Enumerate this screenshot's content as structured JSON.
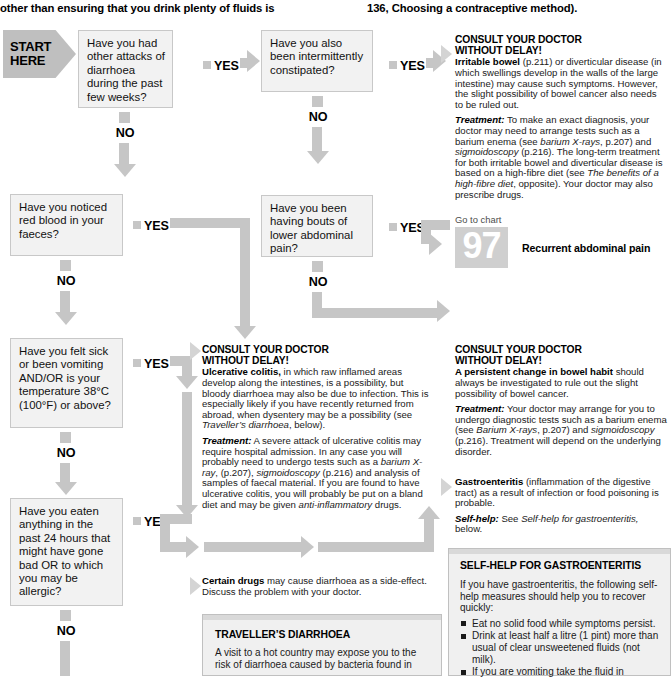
{
  "header": {
    "left_text": "other than ensuring that you drink plenty of fluids is",
    "right_text": "136, Choosing a contraceptive method)."
  },
  "start": {
    "line1": "START",
    "line2": "HERE"
  },
  "labels": {
    "yes": "YES",
    "no": "NO"
  },
  "questions": [
    {
      "id": "q1",
      "text": "Have you had other attacks of diarrhoea during the past few weeks?"
    },
    {
      "id": "q2",
      "text": "Have you also been intermittently constipated?"
    },
    {
      "id": "q3",
      "text": "Have you been having bouts of lower abdominal pain?"
    },
    {
      "id": "q4",
      "text": "Have you noticed red blood in your faeces?"
    },
    {
      "id": "q5",
      "text": "Have you felt sick or been vomiting AND/OR is your temperature 38°C (100°F) or above?"
    },
    {
      "id": "q6",
      "text": "Have you eaten anything in the past 24 hours that might have gone bad OR to which you may be allergic?"
    }
  ],
  "advice_irritable_bowel": {
    "heading_line1": "CONSULT YOUR DOCTOR",
    "heading_line2": "WITHOUT DELAY!",
    "para1_bold": "Irritable bowel",
    "para1_rest": " (p.211) or diverticular disease (in which swellings develop in the walls of the large intestine) may cause such symptoms. However, the slight possibility of bowel cancer also needs to be ruled out.",
    "para2_label": "Treatment:",
    "para2_a": " To make an exact diagnosis, your doctor may need to arrange tests such as a barium enema (see ",
    "para2_i1": "barium X-rays",
    "para2_b": ", p.207) and ",
    "para2_i2": "sigmoidoscopy",
    "para2_c": " (p.216). The long-term treatment for both irritable bowel and diverticular disease is based on a high-fibre diet (see ",
    "para2_i3": "The benefits of a high-fibre diet",
    "para2_d": ", opposite). Your doctor may also prescribe drugs."
  },
  "go_to_chart": {
    "label": "Go to chart",
    "number": "97",
    "caption": "Recurrent abdominal pain"
  },
  "advice_ulcerative": {
    "heading_line1": "CONSULT YOUR DOCTOR",
    "heading_line2": "WITHOUT DELAY!",
    "para1_bold": "Ulcerative colitis,",
    "para1_rest": " in which raw inflamed areas develop along the intestines, is a possibility, but bloody diarrhoea may also be due to infection. This is especially likely if you have recently returned from abroad, when dysentery may be a possibility (see ",
    "para1_i": "Traveller’s diarrhoea",
    "para1_end": ", below).",
    "para2_label": "Treatment:",
    "para2_a": " A severe attack of ulcerative colitis may require hospital admission. In any case you will probably need to undergo tests such as a ",
    "para2_i1": "barium X-ray",
    "para2_b": ", (p.207), ",
    "para2_i2": "sigmoidoscopy",
    "para2_c": " (p.216) and analysis of samples of faecal material. If you are found to have ulcerative colitis, you will probably be put on a bland diet and may be given ",
    "para2_i3": "anti-inflammatory",
    "para2_d": " drugs."
  },
  "advice_bowel_habit": {
    "heading_line1": "CONSULT YOUR DOCTOR",
    "heading_line2": "WITHOUT DELAY!",
    "para1_bold": "A persistent change in bowel habit",
    "para1_rest": " should always be investigated to rule out the slight possibility of bowel cancer.",
    "para2_label": "Treatment:",
    "para2_a": " Your doctor may arrange for you to undergo diagnostic tests such as a barium enema (see ",
    "para2_i1": "Barium X-rays",
    "para2_b": ", p.207) and ",
    "para2_i2": "sigmoidoscopy",
    "para2_c": " (p.216). Treatment will depend on the underlying disorder."
  },
  "advice_gastroenteritis": {
    "para1_bold": "Gastroenteritis",
    "para1_rest": " (inflammation of the digestive tract) as a result of infection or food poisoning is probable.",
    "para2_label": "Self-help:",
    "para2_a": " See ",
    "para2_i": "Self-help for gastroenteritis,",
    "para2_b": " below."
  },
  "advice_certain_drugs": {
    "para1_bold": "Certain drugs",
    "para1_rest": " may cause diarrhoea as a side-effect. Discuss the problem with your doctor."
  },
  "box_travellers": {
    "title": "TRAVELLER’S DIARRHOEA",
    "body": "A visit to a hot country may expose you to the risk of diarrhoea caused by bacteria found in"
  },
  "box_selfhelp": {
    "title": "SELF-HELP FOR GASTROENTERITIS",
    "intro": "If you have gastroenteritis, the following self-help measures should help you to recover quickly:",
    "bullets": [
      "Eat no solid food while symptoms persist.",
      "Drink at least half a litre (1 pint) more than usual of clear unsweetened fluids (not milk).",
      "If you are vomiting take the fluid in"
    ]
  },
  "colors": {
    "flow_arrow": "#c6c6c6",
    "box_fill": "#f2f2f2",
    "box_border": "#c8c8c8",
    "start_fill": "#bfbfbf",
    "chart_num_fill": "#cfcfcf",
    "feature_box_fill": "#f0f0f0"
  }
}
